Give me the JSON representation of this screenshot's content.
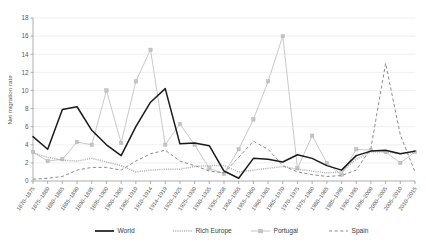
{
  "chart_data": {
    "type": "line",
    "title": "",
    "xlabel": "",
    "ylabel": "Net migration rate",
    "ylim": [
      0,
      18
    ],
    "yticks": [
      0,
      2,
      4,
      6,
      8,
      10,
      12,
      14,
      16,
      18
    ],
    "grid": true,
    "legend_position": "bottom",
    "categories": [
      "1870–1875",
      "1875–1880",
      "1880–1885",
      "1885–1890",
      "1890–1895",
      "1895–1900",
      "1900–1905",
      "1905–1910",
      "1910–1914",
      "1914–1919",
      "1920–1925",
      "1925–1930",
      "1930–1935",
      "1935–1938",
      "1950–1955",
      "1955–1960",
      "1960–1965",
      "1965–1970",
      "1970–1975",
      "1975–1980",
      "1980–1985",
      "1985–1990",
      "1990–1995",
      "1995–2000",
      "2000–2005",
      "2005–2010",
      "2010–2015"
    ],
    "series": [
      {
        "name": "World",
        "color": "#1a1a1a",
        "style": "solid",
        "marker": "none",
        "values": [
          4.9,
          3.5,
          7.9,
          8.2,
          5.6,
          4.0,
          2.8,
          6.0,
          8.7,
          10.2,
          4.1,
          4.2,
          3.9,
          1.1,
          0.3,
          2.5,
          2.4,
          2.1,
          2.9,
          2.5,
          1.7,
          1.2,
          2.8,
          3.3,
          3.4,
          3.0,
          3.3
        ]
      },
      {
        "name": "Rich Europe",
        "color": "#b3b3b3",
        "style": "dotted",
        "marker": "none",
        "values": [
          3.1,
          2.6,
          2.3,
          2.2,
          2.5,
          2.1,
          1.7,
          1.0,
          1.2,
          1.3,
          1.3,
          1.6,
          1.7,
          1.7,
          1.0,
          1.2,
          1.4,
          1.6,
          1.3,
          1.1,
          0.9,
          1.0,
          2.4,
          3.2,
          3.2,
          3.0,
          3.2
        ]
      },
      {
        "name": "Portugal",
        "color": "#c4c4c4",
        "style": "solid",
        "marker": "square",
        "values": [
          3.2,
          2.2,
          2.4,
          4.3,
          4.0,
          10.0,
          4.2,
          11.0,
          14.5,
          4.0,
          6.3,
          4.0,
          1.4,
          0.8,
          3.5,
          6.8,
          11.0,
          16.0,
          1.4,
          5.0,
          2.0,
          0.7,
          3.5,
          3.4,
          3.2,
          2.0,
          3.2
        ]
      },
      {
        "name": "Spain",
        "color": "#8c8c8c",
        "style": "dashed",
        "marker": "none",
        "values": [
          0.2,
          0.3,
          0.5,
          1.2,
          1.5,
          1.5,
          1.2,
          2.2,
          3.0,
          3.4,
          2.2,
          1.7,
          1.1,
          0.9,
          2.6,
          4.4,
          3.5,
          1.7,
          1.0,
          0.7,
          0.5,
          0.6,
          1.2,
          3.6,
          13.0,
          5.1,
          1.0
        ]
      }
    ]
  },
  "legend": {
    "items": [
      {
        "label": "World"
      },
      {
        "label": "Rich Europe"
      },
      {
        "label": "Portugal"
      },
      {
        "label": "Spain"
      }
    ]
  },
  "axis": {
    "y_title": "Net migration rate"
  }
}
